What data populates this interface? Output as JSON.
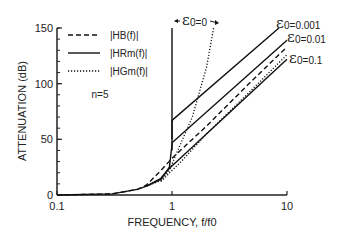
{
  "chart_data": {
    "type": "line",
    "title": "",
    "xlabel": "FREQUENCY, f/f0",
    "ylabel": "ATTENUATION (dB)",
    "xscale": "log",
    "xlim": [
      0.1,
      10
    ],
    "ylim": [
      0,
      150
    ],
    "x_ticks": [
      {
        "v": 0.1,
        "label": "0.1"
      },
      {
        "v": 1,
        "label": "1"
      },
      {
        "v": 10,
        "label": "10"
      }
    ],
    "y_ticks": [
      {
        "v": 0,
        "label": "0"
      },
      {
        "v": 50,
        "label": "50"
      },
      {
        "v": 100,
        "label": "100"
      },
      {
        "v": 150,
        "label": "150"
      }
    ],
    "grid": false,
    "legend_position": "top-left",
    "legend": [
      {
        "label": "|HB(f)|",
        "style": "dashed"
      },
      {
        "label": "|HRm(f)|",
        "style": "solid"
      },
      {
        "label": "|HGm(f)|",
        "style": "dotted"
      }
    ],
    "annotation": "n=5",
    "series": [
      {
        "name": "|HB(f)|",
        "style": "dashed",
        "x": [
          0.1,
          0.3,
          0.5,
          0.6,
          0.8,
          1,
          2,
          5,
          10
        ],
        "y": [
          0,
          1,
          5,
          9,
          22,
          33,
          62,
          103,
          133
        ]
      },
      {
        "name": "|HRm(f)| eps0=0",
        "style": "solid",
        "label": "ε0=0",
        "x": [
          0.1,
          0.3,
          0.5,
          0.6,
          0.8,
          0.95,
          1,
          1
        ],
        "y": [
          0,
          1,
          5,
          8,
          14,
          25,
          45,
          150
        ]
      },
      {
        "name": "|HRm(f)| eps0=0.001",
        "style": "solid",
        "label": "ε0=0.001",
        "x": [
          1,
          1,
          8.5
        ],
        "y": [
          50,
          67,
          150
        ]
      },
      {
        "name": "|HRm(f)| eps0=0.01",
        "style": "solid",
        "label": "ε0=0.01",
        "x": [
          1,
          1,
          10
        ],
        "y": [
          40,
          47,
          139
        ]
      },
      {
        "name": "|HRm(f)| eps0=0.1",
        "style": "solid",
        "label": "ε0=0.1",
        "x": [
          0.6,
          0.8,
          0.95,
          1.1,
          10
        ],
        "y": [
          8,
          15,
          24,
          30,
          122
        ]
      },
      {
        "name": "|HGm(f)| eps0=0",
        "style": "dotted",
        "x": [
          0.6,
          0.8,
          0.95,
          1.1,
          1.5,
          2,
          2.3
        ],
        "y": [
          8,
          13,
          22,
          38,
          70,
          115,
          150
        ]
      },
      {
        "name": "|HGm(f)| eps0=0.1",
        "style": "dotted",
        "x": [
          0.8,
          1,
          1.2,
          2,
          5,
          10
        ],
        "y": [
          12,
          22,
          30,
          55,
          95,
          126
        ]
      }
    ],
    "epsilon_labels": [
      {
        "text": "0=0",
        "for": "ε0=0"
      },
      {
        "text": "0=0.001",
        "for": "ε0=0.001"
      },
      {
        "text": "0=0.01",
        "for": "ε0=0.01"
      },
      {
        "text": "0=0.1",
        "for": "ε0=0.1"
      }
    ],
    "epsilon_symbol": "ε"
  }
}
